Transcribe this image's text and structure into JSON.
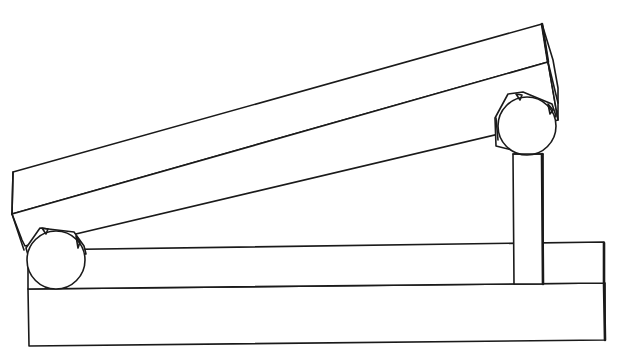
{
  "diagram": {
    "description": "Line drawing of an inclined beam resting on two cylindrical rollers; left roller sits on a base slab, right roller sits atop a vertical post rising from the base.",
    "colors": {
      "stroke": "#1a1a1a",
      "background": "#ffffff"
    },
    "parts": [
      {
        "id": "inclined-beam",
        "label": "Inclined beam"
      },
      {
        "id": "left-roller",
        "label": "Left roller"
      },
      {
        "id": "right-roller",
        "label": "Right roller"
      },
      {
        "id": "support-post",
        "label": "Vertical support post"
      },
      {
        "id": "base-slab",
        "label": "Base slab"
      },
      {
        "id": "base-step",
        "label": "Raised base step"
      }
    ]
  }
}
